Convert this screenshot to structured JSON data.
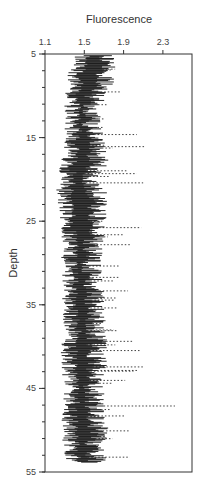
{
  "chart_data": {
    "type": "bar",
    "subtype": "horizontal range/line plot (depth profile)",
    "title": "",
    "xlabel": "Fluorescence",
    "ylabel": "Depth",
    "x_axis_position": "top",
    "xlim": [
      1.1,
      2.55
    ],
    "ylim": [
      5,
      55
    ],
    "y_inverted": true,
    "xticks": [
      1.1,
      1.5,
      1.9,
      2.3
    ],
    "xtick_labels": [
      "1.1",
      "1.5",
      "1.9",
      "2.3"
    ],
    "yticks": [
      5,
      15,
      25,
      35,
      45,
      55
    ],
    "ytick_labels": [
      "5",
      "15",
      "25",
      "35",
      "45",
      "55"
    ],
    "y_minor_tick_step": 2,
    "grid": false,
    "legend": null,
    "data_depth_range": [
      5.2,
      53.9
    ],
    "profile": {
      "depth": [
        5,
        8,
        10,
        12,
        15,
        18,
        20,
        22,
        25,
        27,
        30,
        33,
        35,
        38,
        40,
        42,
        45,
        47,
        50,
        52,
        54
      ],
      "solid_min": [
        1.38,
        1.32,
        1.28,
        1.3,
        1.3,
        1.25,
        1.24,
        1.2,
        1.26,
        1.27,
        1.26,
        1.28,
        1.25,
        1.3,
        1.26,
        1.25,
        1.3,
        1.28,
        1.26,
        1.28,
        1.32
      ],
      "solid_max": [
        1.85,
        1.82,
        1.72,
        1.68,
        1.7,
        1.75,
        1.66,
        1.75,
        1.72,
        1.7,
        1.68,
        1.7,
        1.72,
        1.72,
        1.73,
        1.75,
        1.7,
        1.72,
        1.75,
        1.7,
        1.74
      ],
      "dotted_max": [
        1.95,
        2.1,
        1.95,
        1.85,
        2.1,
        2.25,
        2.15,
        2.25,
        2.1,
        2.2,
        2.1,
        1.95,
        2.05,
        2.0,
        2.15,
        2.25,
        2.05,
        2.5,
        2.05,
        2.0,
        1.95
      ]
    }
  },
  "colors": {
    "ink": "#111111",
    "axis": "#333333",
    "background": "#ffffff"
  }
}
